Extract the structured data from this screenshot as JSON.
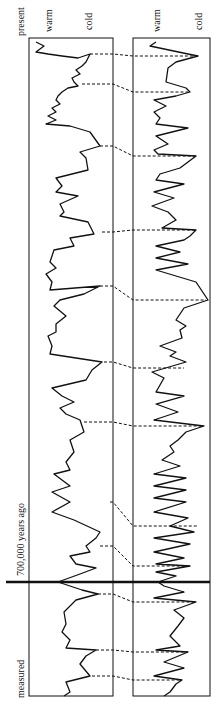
{
  "labels": {
    "present": "present",
    "measured": "measured",
    "boundary": "700,000 years ago",
    "left_warm": "warm",
    "left_cold": "cold",
    "right_warm": "warm",
    "right_cold": "cold"
  },
  "colors": {
    "line": "#111111",
    "background": "#ffffff"
  },
  "chart_data": {
    "type": "line",
    "title": "",
    "orientation": "vertical (time runs top=present to bottom=measured)",
    "xlabel": "warm → cold",
    "ylabel": "time",
    "annotations": [
      "present",
      "700,000 years ago",
      "measured"
    ],
    "boundary_y_px": 582,
    "series": [
      {
        "name": "left record",
        "panel": [
          29,
          38,
          113,
          696
        ],
        "points": [
          [
            36,
            42
          ],
          [
            44,
            46
          ],
          [
            36,
            52
          ],
          [
            48,
            54
          ],
          [
            62,
            56
          ],
          [
            78,
            58
          ],
          [
            90,
            54
          ],
          [
            86,
            62
          ],
          [
            82,
            66
          ],
          [
            76,
            70
          ],
          [
            80,
            74
          ],
          [
            72,
            78
          ],
          [
            74,
            82
          ],
          [
            78,
            86
          ],
          [
            68,
            88
          ],
          [
            62,
            92
          ],
          [
            58,
            96
          ],
          [
            56,
            100
          ],
          [
            60,
            104
          ],
          [
            52,
            108
          ],
          [
            56,
            112
          ],
          [
            48,
            116
          ],
          [
            56,
            120
          ],
          [
            46,
            124
          ],
          [
            70,
            126
          ],
          [
            90,
            132
          ],
          [
            100,
            146
          ],
          [
            80,
            152
          ],
          [
            86,
            158
          ],
          [
            88,
            170
          ],
          [
            56,
            178
          ],
          [
            62,
            186
          ],
          [
            56,
            192
          ],
          [
            78,
            196
          ],
          [
            60,
            204
          ],
          [
            64,
            212
          ],
          [
            60,
            216
          ],
          [
            88,
            222
          ],
          [
            94,
            234
          ],
          [
            70,
            238
          ],
          [
            74,
            246
          ],
          [
            54,
            250
          ],
          [
            50,
            262
          ],
          [
            56,
            268
          ],
          [
            46,
            274
          ],
          [
            52,
            282
          ],
          [
            50,
            290
          ],
          [
            100,
            286
          ],
          [
            84,
            294
          ],
          [
            60,
            300
          ],
          [
            54,
            306
          ],
          [
            66,
            316
          ],
          [
            56,
            324
          ],
          [
            56,
            332
          ],
          [
            48,
            336
          ],
          [
            52,
            346
          ],
          [
            50,
            354
          ],
          [
            102,
            362
          ],
          [
            92,
            370
          ],
          [
            86,
            380
          ],
          [
            52,
            388
          ],
          [
            62,
            396
          ],
          [
            74,
            402
          ],
          [
            60,
            408
          ],
          [
            66,
            414
          ],
          [
            80,
            420
          ],
          [
            84,
            432
          ],
          [
            70,
            440
          ],
          [
            74,
            452
          ],
          [
            66,
            462
          ],
          [
            70,
            470
          ],
          [
            54,
            474
          ],
          [
            70,
            486
          ],
          [
            52,
            492
          ],
          [
            70,
            502
          ],
          [
            52,
            512
          ],
          [
            74,
            520
          ],
          [
            100,
            532
          ],
          [
            96,
            538
          ],
          [
            86,
            546
          ],
          [
            90,
            552
          ],
          [
            70,
            556
          ],
          [
            76,
            564
          ],
          [
            96,
            568
          ],
          [
            80,
            574
          ],
          [
            58,
            582
          ],
          [
            82,
            590
          ],
          [
            98,
            594
          ],
          [
            76,
            600
          ],
          [
            64,
            612
          ],
          [
            66,
            624
          ],
          [
            62,
            632
          ],
          [
            70,
            640
          ],
          [
            66,
            648
          ],
          [
            96,
            650
          ],
          [
            86,
            656
          ],
          [
            80,
            664
          ],
          [
            90,
            676
          ],
          [
            66,
            682
          ],
          [
            70,
            692
          ],
          [
            64,
            696
          ]
        ]
      },
      {
        "name": "right record",
        "panel": [
          133,
          38,
          210,
          696
        ],
        "points": [
          [
            156,
            42
          ],
          [
            150,
            46
          ],
          [
            188,
            54
          ],
          [
            198,
            56
          ],
          [
            176,
            62
          ],
          [
            168,
            68
          ],
          [
            166,
            82
          ],
          [
            186,
            88
          ],
          [
            190,
            92
          ],
          [
            176,
            96
          ],
          [
            154,
            100
          ],
          [
            166,
            106
          ],
          [
            154,
            112
          ],
          [
            160,
            118
          ],
          [
            156,
            124
          ],
          [
            188,
            128
          ],
          [
            156,
            136
          ],
          [
            168,
            144
          ],
          [
            154,
            150
          ],
          [
            158,
            154
          ],
          [
            196,
            156
          ],
          [
            188,
            162
          ],
          [
            180,
            168
          ],
          [
            160,
            174
          ],
          [
            156,
            180
          ],
          [
            184,
            184
          ],
          [
            154,
            192
          ],
          [
            174,
            198
          ],
          [
            152,
            206
          ],
          [
            168,
            212
          ],
          [
            176,
            220
          ],
          [
            162,
            228
          ],
          [
            196,
            230
          ],
          [
            190,
            236
          ],
          [
            184,
            240
          ],
          [
            156,
            246
          ],
          [
            180,
            252
          ],
          [
            156,
            258
          ],
          [
            188,
            264
          ],
          [
            156,
            270
          ],
          [
            196,
            282
          ],
          [
            208,
            300
          ],
          [
            184,
            308
          ],
          [
            180,
            314
          ],
          [
            176,
            320
          ],
          [
            186,
            326
          ],
          [
            180,
            330
          ],
          [
            182,
            338
          ],
          [
            160,
            346
          ],
          [
            176,
            352
          ],
          [
            170,
            356
          ],
          [
            186,
            362
          ],
          [
            152,
            372
          ],
          [
            164,
            378
          ],
          [
            156,
            392
          ],
          [
            184,
            396
          ],
          [
            156,
            404
          ],
          [
            178,
            412
          ],
          [
            154,
            420
          ],
          [
            204,
            426
          ],
          [
            186,
            432
          ],
          [
            178,
            440
          ],
          [
            170,
            446
          ],
          [
            174,
            452
          ],
          [
            162,
            460
          ],
          [
            180,
            466
          ],
          [
            154,
            474
          ],
          [
            186,
            478
          ],
          [
            154,
            486
          ],
          [
            186,
            490
          ],
          [
            154,
            498
          ],
          [
            186,
            502
          ],
          [
            154,
            512
          ],
          [
            188,
            518
          ],
          [
            170,
            526
          ],
          [
            194,
            532
          ],
          [
            154,
            538
          ],
          [
            190,
            544
          ],
          [
            154,
            552
          ],
          [
            184,
            558
          ],
          [
            156,
            564
          ],
          [
            190,
            566
          ],
          [
            156,
            572
          ],
          [
            176,
            576
          ],
          [
            158,
            582
          ],
          [
            164,
            586
          ],
          [
            184,
            592
          ],
          [
            154,
            598
          ],
          [
            196,
            602
          ],
          [
            174,
            610
          ],
          [
            184,
            618
          ],
          [
            178,
            626
          ],
          [
            170,
            636
          ],
          [
            180,
            646
          ],
          [
            156,
            650
          ],
          [
            188,
            652
          ],
          [
            164,
            662
          ],
          [
            184,
            668
          ],
          [
            154,
            676
          ],
          [
            182,
            680
          ],
          [
            176,
            684
          ],
          [
            170,
            692
          ],
          [
            164,
            696
          ]
        ]
      }
    ],
    "correlations": [
      [
        [
          90,
          54
        ],
        [
          198,
          56
        ]
      ],
      [
        [
          82,
          84
        ],
        [
          190,
          92
        ]
      ],
      [
        [
          100,
          146
        ],
        [
          196,
          156
        ]
      ],
      [
        [
          102,
          232
        ],
        [
          196,
          230
        ]
      ],
      [
        [
          100,
          286
        ],
        [
          206,
          300
        ]
      ],
      [
        [
          104,
          362
        ],
        [
          184,
          368
        ]
      ],
      [
        [
          84,
          422
        ],
        [
          204,
          426
        ]
      ],
      [
        [
          110,
          502
        ],
        [
          198,
          526
        ]
      ],
      [
        [
          100,
          546
        ],
        [
          190,
          566
        ]
      ],
      [
        [
          98,
          594
        ],
        [
          196,
          602
        ]
      ],
      [
        [
          96,
          650
        ],
        [
          188,
          652
        ]
      ],
      [
        [
          92,
          676
        ],
        [
          180,
          680
        ]
      ]
    ]
  }
}
